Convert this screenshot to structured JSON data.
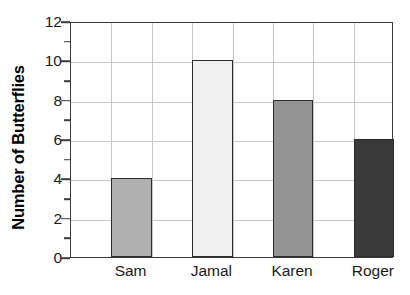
{
  "chart_data": {
    "type": "bar",
    "title": "",
    "subtitle": "",
    "xlabel": "",
    "ylabel": "Number of Butterflies",
    "categories": [
      "Sam",
      "Jamal",
      "Karen",
      "Roger"
    ],
    "values": [
      4,
      10,
      8,
      6
    ],
    "ylim": [
      0,
      12
    ],
    "y_major_ticks": [
      0,
      2,
      4,
      6,
      8,
      10,
      12
    ],
    "y_minor_ticks": [
      1,
      3,
      5,
      7,
      9,
      11
    ],
    "y_tick_labels": [
      "0",
      "2",
      "4",
      "6",
      "8",
      "10",
      "12"
    ],
    "grid": true,
    "grid_axis": "both",
    "legend": false,
    "legend_position": "none",
    "bar_colors": [
      "#b0b0b0",
      "#f0f0f0",
      "#949494",
      "#3a3a3a"
    ],
    "bar_border_color": "#2b2b2b",
    "grid_color": "#c8c8c8",
    "axis_color": "#3c3c3c",
    "background_color": "#ffffff",
    "n_columns": 8,
    "bar_column_slots": [
      1,
      3,
      5,
      7
    ],
    "annotations": []
  },
  "axis": {
    "y_title": "Number of Butterflies"
  }
}
